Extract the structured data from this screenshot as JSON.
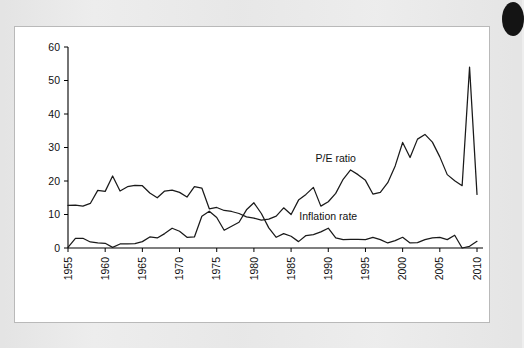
{
  "figure": {
    "background_color": "#ececec",
    "plot_background_color": "#ffffff",
    "frame_border_color": "#b9b9b9",
    "line_color": "#1a1a1a"
  },
  "corner_mark": {
    "name": "page-corner-thumb-mark",
    "color": "#141414"
  },
  "chart_data": {
    "type": "line",
    "title": "",
    "subtitle": "",
    "xlabel": "",
    "ylabel": "",
    "xlim": [
      1955,
      2010
    ],
    "ylim": [
      0,
      60
    ],
    "grid": false,
    "legend_position": "inline-annotation",
    "yticks": [
      0,
      10,
      20,
      30,
      40,
      50,
      60
    ],
    "ytick_labels": [
      "0",
      "10",
      "20",
      "30",
      "40",
      "50",
      "60"
    ],
    "xticks": [
      1955,
      1960,
      1965,
      1970,
      1975,
      1980,
      1985,
      1990,
      1995,
      2000,
      2005,
      2010
    ],
    "xtick_labels": [
      "1955",
      "1960",
      "1965",
      "1970",
      "1975",
      "1980",
      "1985",
      "1990",
      "1995",
      "2000",
      "2005",
      "2010"
    ],
    "xtick_rotation": 90,
    "annotations": [
      {
        "text": "P/E ratio",
        "x": 1991.0,
        "y": 25.6
      },
      {
        "text": "Inflation rate",
        "x": 1990.0,
        "y": 8.4
      }
    ],
    "x": [
      1955,
      1956,
      1957,
      1958,
      1959,
      1960,
      1961,
      1962,
      1963,
      1964,
      1965,
      1966,
      1967,
      1968,
      1969,
      1970,
      1971,
      1972,
      1973,
      1974,
      1975,
      1976,
      1977,
      1978,
      1979,
      1980,
      1981,
      1982,
      1983,
      1984,
      1985,
      1986,
      1987,
      1988,
      1989,
      1990,
      1991,
      1992,
      1993,
      1994,
      1995,
      1996,
      1997,
      1998,
      1999,
      2000,
      2001,
      2002,
      2003,
      2004,
      2005,
      2006,
      2007,
      2008,
      2009,
      2010
    ],
    "series": [
      {
        "name": "P/E ratio",
        "values": [
          12.7,
          12.8,
          12.5,
          13.3,
          17.2,
          16.9,
          21.5,
          17.0,
          18.3,
          18.7,
          18.6,
          16.4,
          15.0,
          17.0,
          17.3,
          16.6,
          15.2,
          18.3,
          17.9,
          11.7,
          12.1,
          11.2,
          10.9,
          10.3,
          9.3,
          8.9,
          8.3,
          8.6,
          9.5,
          12.0,
          10.0,
          14.3,
          16.0,
          18.1,
          12.5,
          13.8,
          16.3,
          20.5,
          23.3,
          21.9,
          20.2,
          16.1,
          16.6,
          19.5,
          24.5,
          31.5,
          27.0,
          32.5,
          33.9,
          31.6,
          27.2,
          21.9,
          20.1,
          18.6,
          54.0,
          16.0
        ]
      },
      {
        "name": "Inflation rate",
        "values": [
          0.2,
          2.9,
          2.9,
          1.8,
          1.5,
          1.4,
          0.2,
          1.2,
          1.2,
          1.3,
          1.9,
          3.3,
          3.0,
          4.3,
          5.9,
          5.0,
          3.2,
          3.3,
          9.5,
          11.0,
          9.1,
          5.3,
          6.5,
          7.7,
          11.4,
          13.5,
          10.3,
          6.0,
          3.2,
          4.3,
          3.5,
          1.9,
          3.7,
          4.0,
          4.8,
          5.9,
          3.0,
          2.5,
          2.6,
          2.6,
          2.5,
          3.2,
          2.5,
          1.5,
          2.2,
          3.2,
          1.5,
          1.6,
          2.5,
          3.0,
          3.2,
          2.5,
          3.8,
          0.0,
          0.5,
          2.0
        ]
      }
    ]
  }
}
